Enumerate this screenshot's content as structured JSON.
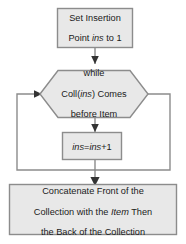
{
  "diagram": {
    "type": "flowchart",
    "colors": {
      "node_fill": "#e8e8e8",
      "node_stroke": "#8c8c8c",
      "connector": "#8c8c8c",
      "text": "#1a1a1a",
      "background": "#ffffff"
    },
    "nodes": [
      {
        "id": "start",
        "shape": "rectangle",
        "lines": [
          "Set Insertion",
          "Point ins to 1"
        ],
        "italic_terms": [
          "ins"
        ],
        "text": "Set Insertion Point ins to 1"
      },
      {
        "id": "decision",
        "shape": "hexagon",
        "lines": [
          "while",
          "Coll(ins) Comes",
          "before Item"
        ],
        "italic_terms": [
          "ins"
        ],
        "text": "while Coll(ins) Comes before Item"
      },
      {
        "id": "process",
        "shape": "rectangle",
        "lines": [
          "ins=ins+1"
        ],
        "italic_terms": [
          "ins",
          "ins"
        ],
        "text": "ins=ins+1"
      },
      {
        "id": "end",
        "shape": "rectangle",
        "lines": [
          "Concatenate Front of the",
          "Collection with the Item Then",
          "the Back of the Collection"
        ],
        "italic_terms": [
          "Item"
        ],
        "text": "Concatenate Front of the Collection with the Item Then the Back of the Collection"
      }
    ],
    "edges": [
      {
        "id": "start-to-decision",
        "from": "start",
        "to": "decision",
        "arrow": true
      },
      {
        "id": "decision-to-process",
        "from": "decision",
        "to": "process",
        "arrow": true
      },
      {
        "id": "process-loopback",
        "from": "process",
        "to": "decision",
        "arrow": true
      },
      {
        "id": "decision-to-end",
        "from": "decision",
        "to": "end",
        "arrow": true
      }
    ]
  }
}
